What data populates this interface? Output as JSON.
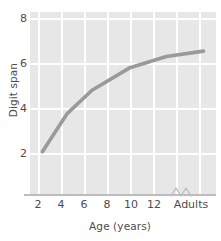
{
  "chart_data": {
    "type": "line",
    "title": "",
    "xlabel": "Age (years)",
    "ylabel": "Digit span",
    "x": [
      2,
      4,
      6,
      9,
      12,
      15
    ],
    "x_tick_labels": [
      "2",
      "4",
      "6",
      "8",
      "10",
      "12",
      "Adults"
    ],
    "x_tick_values": [
      2,
      4,
      6,
      8,
      10,
      12,
      15
    ],
    "y_tick_labels": [
      "2",
      "4",
      "6",
      "8"
    ],
    "y_tick_values": [
      2,
      4,
      6,
      8
    ],
    "values": [
      2.0,
      3.8,
      4.9,
      5.95,
      6.5,
      6.75
    ],
    "xlim": [
      1,
      16
    ],
    "ylim": [
      0,
      8.6
    ],
    "grid": true,
    "legend": "none",
    "axis_break": true,
    "axis_break_position": "between 12 and Adults",
    "line_color": "#9a9a9a",
    "plot_background": "#e7e7e7",
    "gridline_color": "#ffffff",
    "axis_color": "#bdbdbd",
    "text_color": "#4d4d4d"
  }
}
